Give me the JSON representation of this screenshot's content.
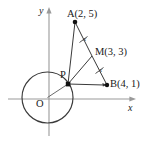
{
  "figure": {
    "stroke_color": "#3a3a3a",
    "point_color": "#111111",
    "axis_color": "#8c8c8c",
    "background": "#ffffff"
  },
  "axes": {
    "x_label": "x",
    "y_label": "y",
    "origin_label": "O"
  },
  "points": [
    {
      "id": "A",
      "label": "A(2, 5)",
      "x": 2,
      "y": 5,
      "px": 75,
      "py": 22
    },
    {
      "id": "M",
      "label": "M(3, 3)",
      "x": 3,
      "y": 3,
      "px": 92,
      "py": 56
    },
    {
      "id": "B",
      "label": "B(4, 1)",
      "x": 4,
      "y": 1,
      "px": 107,
      "py": 85
    },
    {
      "id": "P",
      "label": "P",
      "px": 68,
      "py": 84
    }
  ],
  "circle": {
    "center_label": "O",
    "cx": 47.5,
    "cy": 97.5,
    "r": 25.5
  },
  "segments": [
    {
      "from": "P",
      "to": "A"
    },
    {
      "from": "P",
      "to": "M"
    },
    {
      "from": "P",
      "to": "B"
    },
    {
      "from": "A",
      "to": "M"
    },
    {
      "from": "M",
      "to": "B"
    },
    {
      "from": "O",
      "to": "P"
    }
  ],
  "tick_marks": [
    {
      "on": "AM",
      "label": "x"
    },
    {
      "on": "MB",
      "label": "x"
    }
  ]
}
